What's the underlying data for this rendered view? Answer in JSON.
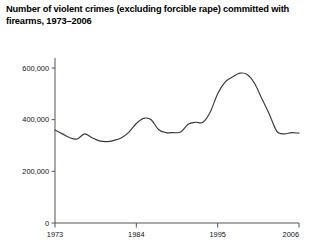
{
  "chart_data": {
    "type": "line",
    "title": "Number of violent crimes (excluding forcible rape) committed with firearms, 1973–2006",
    "xlabel": "",
    "ylabel": "",
    "xlim": [
      1973,
      2006
    ],
    "ylim": [
      0,
      600000
    ],
    "grid": false,
    "legend": null,
    "y_ticks": [
      0,
      200000,
      400000,
      600000
    ],
    "y_tick_labels": [
      "0",
      "200,000",
      "400,000",
      "600,000"
    ],
    "x_ticks": [
      1973,
      1984,
      1995,
      2006
    ],
    "x_tick_labels": [
      "1973",
      "1984",
      "1995",
      "2006"
    ],
    "series": [
      {
        "name": "Violent crimes committed with firearms",
        "color": "#3a3a3a",
        "x": [
          1973,
          1974,
          1975,
          1976,
          1977,
          1978,
          1979,
          1980,
          1981,
          1982,
          1983,
          1984,
          1985,
          1986,
          1987,
          1988,
          1989,
          1990,
          1991,
          1992,
          1993,
          1994,
          1995,
          1996,
          1997,
          1998,
          1999,
          2000,
          2001,
          2002,
          2003,
          2004,
          2005,
          2006
        ],
        "values": [
          360000,
          345000,
          330000,
          325000,
          345000,
          330000,
          318000,
          315000,
          320000,
          330000,
          352000,
          385000,
          405000,
          400000,
          362000,
          350000,
          350000,
          352000,
          382000,
          390000,
          390000,
          430000,
          500000,
          545000,
          565000,
          580000,
          575000,
          540000,
          480000,
          420000,
          355000,
          345000,
          350000,
          348000
        ],
        "note_values_estimated_from_axes": true
      }
    ],
    "annotations": [],
    "peak": {
      "year": 1998,
      "value": 580000
    },
    "minimum": {
      "year": 1980,
      "value": 315000
    }
  },
  "axes": {
    "axis_color": "#555555",
    "line_color": "#3a3a3a"
  }
}
